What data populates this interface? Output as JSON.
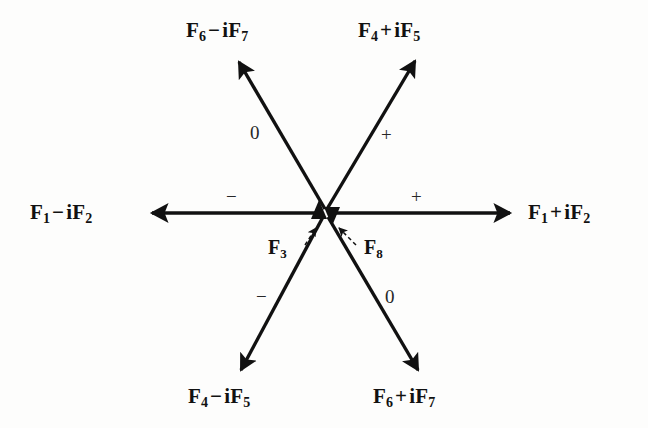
{
  "figure": {
    "type": "root-diagram",
    "background_color": "#fdfdfc",
    "ink_color": "#111111",
    "center": {
      "x": 325,
      "y": 213
    }
  },
  "axis_labels": [
    {
      "id": "f1-minus-if2",
      "name": "label-f1-minus-if2",
      "base": "F",
      "sub1": "1",
      "operator": "−",
      "imaginary": "iF",
      "sub2": "2",
      "full_text": "F₁ − iF₂",
      "x": 30,
      "y": 202,
      "anchor": "left"
    },
    {
      "id": "f1-plus-if2",
      "name": "label-f1-plus-if2",
      "base": "F",
      "sub1": "1",
      "operator": "+",
      "imaginary": "iF",
      "sub2": "2",
      "full_text": "F₁ + iF₂",
      "x": 528,
      "y": 202,
      "anchor": "left"
    },
    {
      "id": "f4-plus-if5",
      "name": "label-f4-plus-if5",
      "base": "F",
      "sub1": "4",
      "operator": "+",
      "imaginary": "iF",
      "sub2": "5",
      "full_text": "F₄ + iF₅",
      "x": 358,
      "y": 18,
      "anchor": "left"
    },
    {
      "id": "f6-minus-if7",
      "name": "label-f6-minus-if7",
      "base": "F",
      "sub1": "6",
      "operator": "−",
      "imaginary": "iF",
      "sub2": "7",
      "full_text": "F₆ − iF₇",
      "x": 186,
      "y": 18,
      "anchor": "left"
    },
    {
      "id": "f4-minus-if5",
      "name": "label-f4-minus-if5",
      "base": "F",
      "sub1": "4",
      "operator": "−",
      "imaginary": "iF",
      "sub2": "5",
      "full_text": "F₄ − iF₅",
      "x": 188,
      "y": 384,
      "anchor": "left"
    },
    {
      "id": "f6-plus-if7",
      "name": "label-f6-plus-if7",
      "base": "F",
      "sub1": "6",
      "operator": "+",
      "imaginary": "iF",
      "sub2": "7",
      "full_text": "F₆ + iF₇",
      "x": 373,
      "y": 384,
      "anchor": "left"
    }
  ],
  "center_labels": [
    {
      "id": "f3",
      "name": "label-f3",
      "base": "F",
      "sub1": "3",
      "full_text": "F₃",
      "x": 268,
      "y": 236
    },
    {
      "id": "f8",
      "name": "label-f8",
      "base": "F",
      "sub1": "8",
      "full_text": "F₈",
      "x": 364,
      "y": 236
    }
  ],
  "sign_labels": [
    {
      "id": "sign-upper-left",
      "name": "sign-label-upper-left",
      "text": "0",
      "x": 250,
      "y": 122
    },
    {
      "id": "sign-upper-right",
      "name": "sign-label-upper-right",
      "text": "+",
      "x": 381,
      "y": 124
    },
    {
      "id": "sign-left",
      "name": "sign-label-left",
      "text": "−",
      "x": 226,
      "y": 186
    },
    {
      "id": "sign-right",
      "name": "sign-label-right",
      "text": "+",
      "x": 411,
      "y": 186
    },
    {
      "id": "sign-lower-left",
      "name": "sign-label-lower-left",
      "text": "−",
      "x": 256,
      "y": 286
    },
    {
      "id": "sign-lower-right",
      "name": "sign-label-lower-right",
      "text": "0",
      "x": 385,
      "y": 286
    }
  ],
  "arrows": [
    {
      "id": "arrow-left",
      "name": "arrow-f1-minus-if2",
      "style": "solid",
      "weight": 3.6,
      "from": {
        "x": 322,
        "y": 213
      },
      "to": {
        "x": 150,
        "y": 213
      }
    },
    {
      "id": "arrow-right",
      "name": "arrow-f1-plus-if2",
      "style": "solid",
      "weight": 3.6,
      "from": {
        "x": 330,
        "y": 213
      },
      "to": {
        "x": 512,
        "y": 213
      }
    },
    {
      "id": "arrow-upper-left",
      "name": "arrow-f6-minus-if7",
      "style": "solid",
      "weight": 3.4,
      "from": {
        "x": 325,
        "y": 209
      },
      "to": {
        "x": 237,
        "y": 58
      }
    },
    {
      "id": "arrow-upper-right",
      "name": "arrow-f4-plus-if5",
      "style": "solid",
      "weight": 3.4,
      "from": {
        "x": 327,
        "y": 209
      },
      "to": {
        "x": 417,
        "y": 57
      }
    },
    {
      "id": "arrow-lower-left",
      "name": "arrow-f4-minus-if5",
      "style": "solid",
      "weight": 3.4,
      "from": {
        "x": 323,
        "y": 217
      },
      "to": {
        "x": 239,
        "y": 374
      }
    },
    {
      "id": "arrow-lower-right",
      "name": "arrow-f6-plus-if7",
      "style": "solid",
      "weight": 3.4,
      "from": {
        "x": 328,
        "y": 217
      },
      "to": {
        "x": 420,
        "y": 374
      }
    },
    {
      "id": "arrow-f3-dashed",
      "name": "arrow-f3-dashed",
      "style": "dashed",
      "weight": 1.5,
      "from": {
        "x": 302,
        "y": 243
      },
      "to": {
        "x": 315,
        "y": 222
      }
    },
    {
      "id": "arrow-f8-dashed",
      "name": "arrow-f8-dashed",
      "style": "dashed",
      "weight": 1.5,
      "from": {
        "x": 358,
        "y": 243
      },
      "to": {
        "x": 336,
        "y": 222
      }
    }
  ],
  "center_markers": [
    {
      "id": "marker-up",
      "name": "center-arrowhead-up",
      "direction": "up",
      "x": 319,
      "y": 213
    },
    {
      "id": "marker-down",
      "name": "center-arrowhead-down",
      "direction": "down",
      "x": 332,
      "y": 212
    }
  ]
}
